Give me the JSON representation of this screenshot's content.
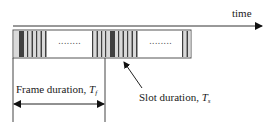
{
  "diagram": {
    "time_label": "time",
    "frame_label": "Frame duration, ",
    "frame_symbol": "T",
    "frame_subscript": "f",
    "slot_label": "Slot duration, ",
    "slot_symbol": "T",
    "slot_subscript": "s",
    "ellipsis": "........",
    "colors": {
      "line": "#333333",
      "slot_light": "#d9d9d9",
      "slot_dark": "#404040",
      "background": "#ffffff"
    }
  }
}
